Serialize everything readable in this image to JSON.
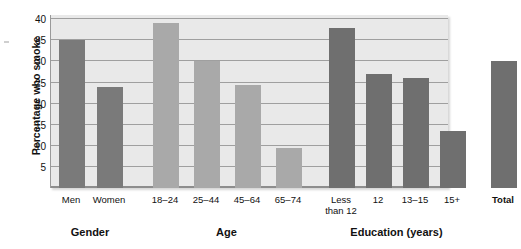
{
  "chart_data": {
    "type": "bar",
    "title": "",
    "xlabel": "",
    "ylabel": "Percentage who smoke",
    "ylim": [
      0,
      41
    ],
    "yticks": [
      5,
      10,
      15,
      20,
      25,
      30,
      35,
      40
    ],
    "grid": true,
    "legend": "none",
    "group_labels": [
      "Gender",
      "Age",
      "Education (years)"
    ],
    "categories": [
      "Men",
      "Women",
      "18–24",
      "25–44",
      "45–64",
      "65–74",
      "Less\nthan 12",
      "12",
      "13–15",
      "15+",
      "Total"
    ],
    "values": [
      35,
      24,
      39,
      30,
      24.5,
      9.5,
      38,
      27,
      26,
      13.5,
      30
    ],
    "bars": [
      {
        "label": "Men",
        "value": 35,
        "group": "Gender",
        "color": "#7a7a7a",
        "bold": false
      },
      {
        "label": "Women",
        "value": 24,
        "group": "Gender",
        "color": "#7a7a7a",
        "bold": false
      },
      {
        "label": "18–24",
        "value": 39,
        "group": "Age",
        "color": "#a9a9a9",
        "bold": false
      },
      {
        "label": "25–44",
        "value": 30,
        "group": "Age",
        "color": "#a9a9a9",
        "bold": false
      },
      {
        "label": "45–64",
        "value": 24.5,
        "group": "Age",
        "color": "#a9a9a9",
        "bold": false
      },
      {
        "label": "65–74",
        "value": 9.5,
        "group": "Age",
        "color": "#a9a9a9",
        "bold": false
      },
      {
        "label": "Less\nthan 12",
        "value": 38,
        "group": "Education (years)",
        "color": "#6f6f6f",
        "bold": false
      },
      {
        "label": "12",
        "value": 27,
        "group": "Education (years)",
        "color": "#6f6f6f",
        "bold": false
      },
      {
        "label": "13–15",
        "value": 26,
        "group": "Education (years)",
        "color": "#6f6f6f",
        "bold": false
      },
      {
        "label": "15+",
        "value": 13.5,
        "group": "Education (years)",
        "color": "#6f6f6f",
        "bold": false
      },
      {
        "label": "Total",
        "value": 30,
        "group": "",
        "color": "#6f6f6f",
        "bold": true
      }
    ],
    "colors": {
      "plot_background": "#e9e9e9",
      "gridline": "#9f9f9f",
      "gender_bar": "#7a7a7a",
      "age_bar": "#a9a9a9",
      "education_bar": "#6f6f6f",
      "text": "#111111"
    }
  }
}
